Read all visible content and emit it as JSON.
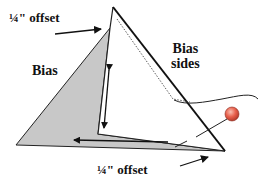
{
  "diagram": {
    "labels": {
      "offset_top": "¼\" offset",
      "bias": "Bias",
      "bias_sides_line1": "Bias",
      "bias_sides_line2": "sides",
      "offset_bottom": "¼\" offset"
    },
    "colors": {
      "fill_gray": "#c8c8c8",
      "stroke": "#111111",
      "pin_head": "#e8604c",
      "pin_highlight": "#f6b3a6",
      "background": "#ffffff"
    }
  }
}
